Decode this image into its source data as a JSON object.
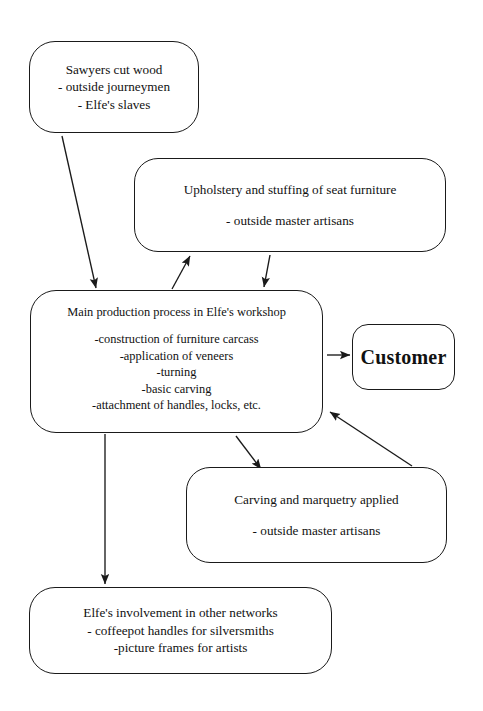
{
  "diagram": {
    "background_color": "#ffffff",
    "stroke_color": "#1a1a1a",
    "nodes": {
      "sawyers": {
        "lines": [
          "Sawyers cut wood",
          "- outside journeymen",
          "- Elfe's slaves"
        ]
      },
      "upholstery": {
        "lines": [
          "Upholstery and stuffing of seat furniture",
          "- outside master artisans"
        ]
      },
      "main": {
        "title": "Main production process in Elfe's workshop",
        "lines": [
          "-construction of furniture carcass",
          "-application of veneers",
          "-turning",
          "-basic carving",
          "-attachment of handles, locks, etc."
        ]
      },
      "customer": {
        "lines": [
          "Customer"
        ]
      },
      "carving": {
        "lines": [
          "Carving and marquetry applied",
          "- outside master artisans"
        ]
      },
      "networks": {
        "lines": [
          "Elfe's involvement in other networks",
          "- coffeepot handles for silversmiths",
          "-picture frames for artists"
        ]
      }
    },
    "edges": [
      {
        "id": "sawyers-to-main",
        "from": "sawyers",
        "to": "main",
        "x1": 62,
        "y1": 136,
        "x2": 96,
        "y2": 288
      },
      {
        "id": "main-to-upholstery",
        "from": "main",
        "to": "upholstery",
        "x1": 172,
        "y1": 289,
        "x2": 190,
        "y2": 256
      },
      {
        "id": "upholstery-to-main",
        "from": "upholstery",
        "to": "main",
        "x1": 270,
        "y1": 255,
        "x2": 264,
        "y2": 287
      },
      {
        "id": "main-to-customer",
        "from": "main",
        "to": "customer",
        "x1": 327,
        "y1": 355,
        "x2": 350,
        "y2": 355
      },
      {
        "id": "main-to-carving",
        "from": "main",
        "to": "carving",
        "x1": 236,
        "y1": 436,
        "x2": 261,
        "y2": 469
      },
      {
        "id": "carving-to-main",
        "from": "carving",
        "to": "main",
        "x1": 412,
        "y1": 466,
        "x2": 330,
        "y2": 412
      },
      {
        "id": "main-to-networks",
        "from": "main",
        "to": "networks",
        "x1": 105,
        "y1": 434,
        "x2": 105,
        "y2": 584
      }
    ]
  }
}
